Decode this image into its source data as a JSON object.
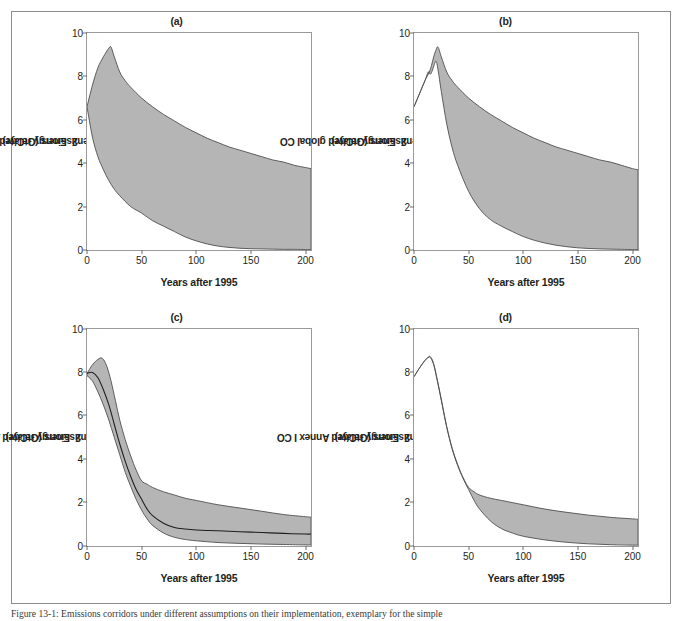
{
  "figure": {
    "caption": "Figure 13-1: Emissions corridors under different assumptions on their implementation, exemplary for the simple",
    "colors": {
      "band_fill": "#b5b5b5",
      "band_stroke": "#4d4d4d",
      "median_line": "#1f1f1f",
      "axis": "#9a9a9a",
      "frame": "#8d8d8d",
      "text": "#231f20"
    }
  },
  "axes_common": {
    "xlabel": "Years after 1995",
    "xticks": [
      0,
      50,
      100,
      150,
      200
    ],
    "yticks": [
      0,
      2,
      4,
      6,
      8,
      10
    ],
    "xlim": [
      0,
      205
    ],
    "ylim": [
      0,
      10
    ],
    "grid": false,
    "legend": "none"
  },
  "chart_data": [
    {
      "id": "a",
      "type": "area",
      "title": "(a)",
      "xlabel": "Years after 1995",
      "ylabel_parts": [
        "Energy related global CO",
        "2",
        " emissions (GtC/yr)"
      ],
      "ylabel": "Energy related global CO2 emissions (GtC/yr)",
      "xlim": [
        0,
        205
      ],
      "ylim": [
        0,
        10
      ],
      "xticks": [
        0,
        50,
        100,
        150,
        200
      ],
      "yticks": [
        0,
        2,
        4,
        6,
        8,
        10
      ],
      "series": [
        {
          "name": "upper bound",
          "x": [
            0,
            5,
            10,
            15,
            20,
            22,
            25,
            30,
            35,
            40,
            50,
            60,
            70,
            80,
            90,
            100,
            110,
            120,
            130,
            140,
            150,
            160,
            170,
            180,
            190,
            200,
            205
          ],
          "values": [
            6.6,
            7.6,
            8.4,
            8.9,
            9.3,
            9.35,
            8.9,
            8.2,
            7.8,
            7.5,
            7.0,
            6.6,
            6.25,
            5.95,
            5.65,
            5.4,
            5.15,
            4.95,
            4.75,
            4.6,
            4.45,
            4.3,
            4.15,
            4.05,
            3.9,
            3.8,
            3.75
          ]
        },
        {
          "name": "lower bound",
          "x": [
            0,
            5,
            10,
            15,
            20,
            25,
            30,
            40,
            50,
            60,
            70,
            80,
            90,
            100,
            110,
            120,
            130,
            140,
            150,
            160,
            170,
            180,
            190,
            200,
            205
          ],
          "values": [
            6.6,
            5.2,
            4.3,
            3.7,
            3.2,
            2.8,
            2.5,
            2.0,
            1.7,
            1.35,
            1.1,
            0.85,
            0.6,
            0.42,
            0.28,
            0.18,
            0.12,
            0.08,
            0.06,
            0.05,
            0.04,
            0.03,
            0.03,
            0.02,
            0.02
          ]
        }
      ],
      "has_median_line": false
    },
    {
      "id": "b",
      "type": "area",
      "title": "(b)",
      "xlabel": "Years after 1995",
      "ylabel_parts": [
        "Energy related global CO",
        "2",
        " emissions (GtC/yr)"
      ],
      "ylabel": "Energy related global CO2 emissions (GtC/yr)",
      "xlim": [
        0,
        205
      ],
      "ylim": [
        0,
        10
      ],
      "xticks": [
        0,
        50,
        100,
        150,
        200
      ],
      "yticks": [
        0,
        2,
        4,
        6,
        8,
        10
      ],
      "series": [
        {
          "name": "upper bound",
          "x": [
            0,
            5,
            10,
            14,
            16,
            18,
            20,
            22,
            25,
            30,
            35,
            40,
            50,
            60,
            70,
            80,
            90,
            100,
            110,
            120,
            130,
            140,
            150,
            160,
            170,
            180,
            190,
            200,
            205
          ],
          "values": [
            6.6,
            7.2,
            7.8,
            8.2,
            8.5,
            8.9,
            9.2,
            9.35,
            8.9,
            8.2,
            7.8,
            7.5,
            7.0,
            6.6,
            6.25,
            5.95,
            5.65,
            5.4,
            5.15,
            4.95,
            4.75,
            4.6,
            4.45,
            4.3,
            4.15,
            4.05,
            3.9,
            3.75,
            3.7
          ]
        },
        {
          "name": "lower bound",
          "x": [
            0,
            5,
            10,
            13,
            15,
            17,
            20,
            22,
            25,
            30,
            35,
            40,
            50,
            60,
            70,
            80,
            90,
            100,
            110,
            120,
            130,
            140,
            150,
            160,
            170,
            180,
            190,
            200,
            205
          ],
          "values": [
            6.6,
            7.2,
            7.8,
            8.2,
            8.1,
            8.3,
            8.7,
            8.3,
            7.3,
            5.8,
            4.7,
            3.9,
            2.7,
            1.9,
            1.4,
            1.1,
            0.85,
            0.62,
            0.45,
            0.32,
            0.22,
            0.15,
            0.1,
            0.07,
            0.05,
            0.04,
            0.03,
            0.02,
            0.02
          ]
        }
      ],
      "has_median_line": false
    },
    {
      "id": "c",
      "type": "area",
      "title": "(c)",
      "xlabel": "Years after 1995",
      "ylabel_parts": [
        "Energy related Annex I CO",
        "2",
        " emissions (GtC/yr)"
      ],
      "ylabel": "Energy related Annex I CO2 emissions (GtC/yr)",
      "xlim": [
        0,
        205
      ],
      "ylim": [
        0,
        10
      ],
      "xticks": [
        0,
        50,
        100,
        150,
        200
      ],
      "yticks": [
        0,
        2,
        4,
        6,
        8,
        10
      ],
      "series": [
        {
          "name": "upper bound",
          "x": [
            0,
            5,
            10,
            14,
            18,
            22,
            26,
            30,
            35,
            40,
            45,
            50,
            55,
            60,
            70,
            80,
            90,
            100,
            120,
            140,
            160,
            180,
            200,
            205
          ],
          "values": [
            7.95,
            8.35,
            8.6,
            8.65,
            8.3,
            7.6,
            6.7,
            5.8,
            4.9,
            4.15,
            3.5,
            3.0,
            2.85,
            2.7,
            2.5,
            2.35,
            2.2,
            2.1,
            1.9,
            1.75,
            1.6,
            1.45,
            1.35,
            1.33
          ]
        },
        {
          "name": "median",
          "x": [
            0,
            5,
            10,
            15,
            20,
            25,
            30,
            35,
            40,
            45,
            50,
            55,
            60,
            70,
            80,
            90,
            100,
            120,
            140,
            160,
            180,
            200,
            205
          ],
          "values": [
            7.95,
            8.0,
            7.75,
            7.2,
            6.5,
            5.6,
            4.7,
            3.9,
            3.2,
            2.6,
            2.15,
            1.7,
            1.4,
            1.05,
            0.85,
            0.78,
            0.74,
            0.7,
            0.66,
            0.62,
            0.58,
            0.55,
            0.55
          ]
        },
        {
          "name": "lower bound",
          "x": [
            0,
            5,
            10,
            15,
            20,
            25,
            30,
            35,
            40,
            45,
            50,
            55,
            60,
            70,
            80,
            90,
            100,
            120,
            140,
            160,
            180,
            200,
            205
          ],
          "values": [
            7.85,
            7.6,
            7.1,
            6.5,
            5.8,
            5.0,
            4.2,
            3.4,
            2.75,
            2.15,
            1.65,
            1.25,
            0.95,
            0.6,
            0.4,
            0.3,
            0.24,
            0.16,
            0.12,
            0.09,
            0.07,
            0.05,
            0.05
          ]
        }
      ],
      "has_median_line": true
    },
    {
      "id": "d",
      "type": "area",
      "title": "(d)",
      "xlabel": "Years after 1995",
      "ylabel_parts": [
        "Energy related Annex I CO",
        "2",
        " emissions (GtC/yr)"
      ],
      "ylabel": "Energy related Annex I CO2 emissions (GtC/yr)",
      "xlim": [
        0,
        205
      ],
      "ylim": [
        0,
        10
      ],
      "xticks": [
        0,
        50,
        100,
        150,
        200
      ],
      "yticks": [
        0,
        2,
        4,
        6,
        8,
        10
      ],
      "series": [
        {
          "name": "upper bound",
          "x": [
            0,
            5,
            10,
            13,
            15,
            18,
            22,
            26,
            30,
            35,
            40,
            45,
            50,
            55,
            60,
            70,
            80,
            90,
            100,
            120,
            140,
            160,
            180,
            200,
            205
          ],
          "values": [
            7.8,
            8.2,
            8.55,
            8.7,
            8.72,
            8.4,
            7.5,
            6.5,
            5.5,
            4.5,
            3.75,
            3.15,
            2.7,
            2.5,
            2.35,
            2.2,
            2.1,
            2.0,
            1.9,
            1.7,
            1.55,
            1.42,
            1.32,
            1.25,
            1.23
          ]
        },
        {
          "name": "lower bound",
          "x": [
            0,
            5,
            10,
            13,
            15,
            18,
            22,
            26,
            30,
            35,
            40,
            45,
            50,
            55,
            60,
            70,
            80,
            90,
            100,
            120,
            140,
            160,
            180,
            200,
            205
          ],
          "values": [
            7.8,
            8.2,
            8.55,
            8.68,
            8.68,
            8.35,
            7.45,
            6.45,
            5.45,
            4.45,
            3.7,
            3.1,
            2.6,
            2.1,
            1.7,
            1.15,
            0.8,
            0.6,
            0.45,
            0.28,
            0.17,
            0.1,
            0.06,
            0.04,
            0.04
          ]
        }
      ],
      "has_median_line": false
    }
  ]
}
